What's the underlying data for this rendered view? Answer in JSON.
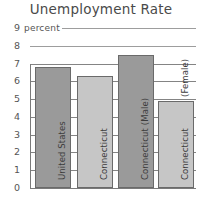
{
  "chart_data": {
    "type": "bar",
    "title": "Unemployment Rate",
    "xlabel": "",
    "ylabel": "percent",
    "ylim": [
      0,
      9
    ],
    "grid": true,
    "legend": "none",
    "categories": [
      "United States",
      "Connecticut",
      "Connecticut (Male)",
      "Connecticut (Female)"
    ],
    "bar_labels": [
      "United States",
      "Connecticut",
      "Connecticut (Male)",
      "Connecticut"
    ],
    "bar_sublabels": [
      "",
      "",
      "",
      "(Female)"
    ],
    "values": [
      6.8,
      6.3,
      7.5,
      4.9
    ],
    "bar_colors": [
      "#9a9a9a",
      "#c6c6c6",
      "#9a9a9a",
      "#c6c6c6"
    ],
    "y_ticks": [
      "9",
      "8",
      "7",
      "6",
      "5",
      "4",
      "3",
      "2",
      "1",
      "0"
    ],
    "y_tick_values": [
      9,
      8,
      7,
      6,
      5,
      4,
      3,
      2,
      1,
      0
    ],
    "axis_color": "#7a7a7a",
    "grid_color": "#6f6f6f",
    "text_color": "#4a4a4a"
  }
}
